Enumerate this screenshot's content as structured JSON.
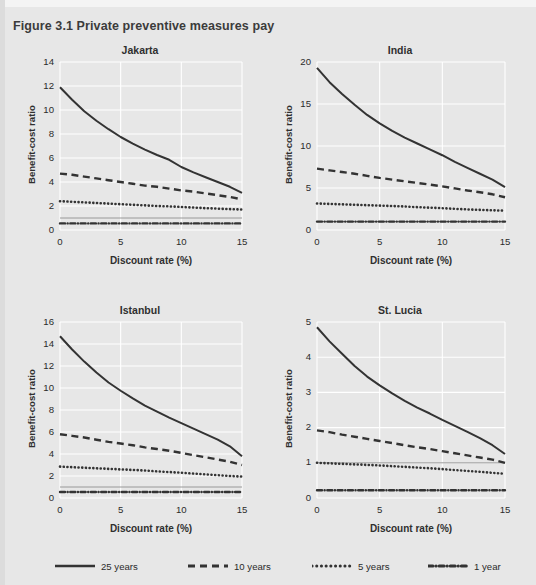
{
  "figure": {
    "title": "Figure 3.1  Private preventive measures pay",
    "background_color": "#e7e7e7",
    "grid_color": "#ffffff",
    "line_color": "#333333"
  },
  "axis_titles": {
    "x": "Discount rate (%)",
    "y": "Benefit-cost ratio"
  },
  "legend": {
    "position": "bottom",
    "items": [
      {
        "label": "25 years",
        "style": "solid",
        "icon": "solid-line-icon"
      },
      {
        "label": "10 years",
        "style": "dashed",
        "icon": "dashed-line-icon"
      },
      {
        "label": "5 years",
        "style": "dotted",
        "icon": "dotted-line-icon"
      },
      {
        "label": "1 year",
        "style": "dashdot",
        "icon": "dashdot-line-icon"
      }
    ]
  },
  "chart_data": [
    {
      "type": "line",
      "title": "Jakarta",
      "xlabel": "Discount rate (%)",
      "ylabel": "Benefit-cost ratio",
      "xlim": [
        0,
        15
      ],
      "ylim": [
        0,
        14
      ],
      "xticks": [
        0,
        5,
        10,
        15
      ],
      "yticks": [
        0,
        2,
        4,
        6,
        8,
        10,
        12,
        14
      ],
      "grid": true,
      "reference_line_y": 1,
      "x": [
        0,
        1,
        2,
        3,
        4,
        5,
        6,
        7,
        8,
        9,
        10,
        11,
        12,
        13,
        14,
        15
      ],
      "series": [
        {
          "name": "25 years",
          "style": "solid",
          "values": [
            11.9,
            10.85,
            9.9,
            9.1,
            8.4,
            7.75,
            7.2,
            6.7,
            6.25,
            5.85,
            5.25,
            4.8,
            4.4,
            4.0,
            3.6,
            3.1
          ]
        },
        {
          "name": "10 years",
          "style": "dashed",
          "values": [
            4.7,
            4.6,
            4.45,
            4.3,
            4.15,
            4.0,
            3.85,
            3.7,
            3.6,
            3.45,
            3.3,
            3.2,
            3.05,
            2.9,
            2.75,
            2.55
          ]
        },
        {
          "name": "5 years",
          "style": "dotted",
          "values": [
            2.4,
            2.35,
            2.3,
            2.25,
            2.2,
            2.15,
            2.1,
            2.05,
            2.0,
            1.97,
            1.92,
            1.87,
            1.82,
            1.78,
            1.74,
            1.7
          ]
        },
        {
          "name": "1 year",
          "style": "dashdot",
          "values": [
            0.55,
            0.55,
            0.55,
            0.55,
            0.55,
            0.55,
            0.55,
            0.55,
            0.55,
            0.55,
            0.55,
            0.55,
            0.55,
            0.55,
            0.55,
            0.55
          ]
        }
      ]
    },
    {
      "type": "line",
      "title": "India",
      "xlabel": "Discount rate (%)",
      "ylabel": "Benefit-cost ratio",
      "xlim": [
        0,
        15
      ],
      "ylim": [
        0,
        20
      ],
      "xticks": [
        0,
        5,
        10,
        15
      ],
      "yticks": [
        0,
        5,
        10,
        15,
        20
      ],
      "grid": true,
      "reference_line_y": 1,
      "x": [
        0,
        1,
        2,
        3,
        4,
        5,
        6,
        7,
        8,
        9,
        10,
        11,
        12,
        13,
        14,
        15
      ],
      "series": [
        {
          "name": "25 years",
          "style": "solid",
          "values": [
            19.3,
            17.6,
            16.2,
            14.9,
            13.7,
            12.7,
            11.8,
            11.0,
            10.3,
            9.6,
            8.9,
            8.1,
            7.4,
            6.7,
            6.0,
            5.1
          ]
        },
        {
          "name": "10 years",
          "style": "dashed",
          "values": [
            7.3,
            7.1,
            6.9,
            6.7,
            6.45,
            6.2,
            6.0,
            5.8,
            5.6,
            5.4,
            5.2,
            4.95,
            4.7,
            4.5,
            4.25,
            3.9
          ]
        },
        {
          "name": "5 years",
          "style": "dotted",
          "values": [
            3.15,
            3.1,
            3.05,
            3.0,
            2.95,
            2.9,
            2.85,
            2.8,
            2.72,
            2.66,
            2.6,
            2.52,
            2.45,
            2.4,
            2.35,
            2.3
          ]
        },
        {
          "name": "1 year",
          "style": "dashdot",
          "values": [
            1.0,
            1.0,
            1.0,
            1.0,
            1.0,
            1.0,
            1.0,
            1.0,
            1.0,
            1.0,
            1.0,
            1.0,
            1.0,
            1.0,
            1.0,
            1.0
          ]
        }
      ]
    },
    {
      "type": "line",
      "title": "Istanbul",
      "xlabel": "Discount rate (%)",
      "ylabel": "Benefit-cost ratio",
      "xlim": [
        0,
        15
      ],
      "ylim": [
        0,
        16
      ],
      "xticks": [
        0,
        5,
        10,
        15
      ],
      "yticks": [
        0,
        2,
        4,
        6,
        8,
        10,
        12,
        14,
        16
      ],
      "grid": true,
      "reference_line_y": 1,
      "x": [
        0,
        1,
        2,
        3,
        4,
        5,
        6,
        7,
        8,
        9,
        10,
        11,
        12,
        13,
        14,
        15
      ],
      "series": [
        {
          "name": "25 years",
          "style": "solid",
          "values": [
            14.7,
            13.5,
            12.4,
            11.4,
            10.5,
            9.75,
            9.05,
            8.4,
            7.85,
            7.3,
            6.8,
            6.3,
            5.8,
            5.3,
            4.7,
            3.8
          ]
        },
        {
          "name": "10 years",
          "style": "dashed",
          "values": [
            5.8,
            5.65,
            5.5,
            5.3,
            5.1,
            4.95,
            4.8,
            4.6,
            4.45,
            4.3,
            4.1,
            3.9,
            3.7,
            3.5,
            3.3,
            3.0
          ]
        },
        {
          "name": "5 years",
          "style": "dotted",
          "values": [
            2.85,
            2.8,
            2.75,
            2.7,
            2.65,
            2.6,
            2.55,
            2.5,
            2.42,
            2.36,
            2.3,
            2.22,
            2.15,
            2.08,
            2.0,
            1.95
          ]
        },
        {
          "name": "1 year",
          "style": "dashdot",
          "values": [
            0.55,
            0.55,
            0.55,
            0.55,
            0.55,
            0.55,
            0.55,
            0.55,
            0.55,
            0.55,
            0.55,
            0.55,
            0.55,
            0.55,
            0.55,
            0.55
          ]
        }
      ]
    },
    {
      "type": "line",
      "title": "St. Lucia",
      "xlabel": "Discount rate (%)",
      "ylabel": "Benefit-cost ratio",
      "xlim": [
        0,
        15
      ],
      "ylim": [
        0,
        5
      ],
      "xticks": [
        0,
        5,
        10,
        15
      ],
      "yticks": [
        0,
        1,
        2,
        3,
        4,
        5
      ],
      "grid": true,
      "reference_line_y": 1,
      "x": [
        0,
        1,
        2,
        3,
        4,
        5,
        6,
        7,
        8,
        9,
        10,
        11,
        12,
        13,
        14,
        15
      ],
      "series": [
        {
          "name": "25 years",
          "style": "solid",
          "values": [
            4.85,
            4.45,
            4.1,
            3.75,
            3.45,
            3.2,
            2.97,
            2.76,
            2.57,
            2.4,
            2.22,
            2.05,
            1.88,
            1.7,
            1.5,
            1.25
          ]
        },
        {
          "name": "10 years",
          "style": "dashed",
          "values": [
            1.92,
            1.87,
            1.8,
            1.74,
            1.68,
            1.62,
            1.56,
            1.5,
            1.44,
            1.39,
            1.33,
            1.27,
            1.21,
            1.15,
            1.09,
            1.0
          ]
        },
        {
          "name": "5 years",
          "style": "dotted",
          "values": [
            1.0,
            0.985,
            0.97,
            0.955,
            0.94,
            0.925,
            0.905,
            0.885,
            0.865,
            0.845,
            0.82,
            0.795,
            0.77,
            0.745,
            0.715,
            0.69
          ]
        },
        {
          "name": "1 year",
          "style": "dashdot",
          "values": [
            0.22,
            0.22,
            0.22,
            0.22,
            0.22,
            0.22,
            0.22,
            0.22,
            0.22,
            0.22,
            0.22,
            0.22,
            0.22,
            0.22,
            0.22,
            0.22
          ]
        }
      ]
    }
  ]
}
